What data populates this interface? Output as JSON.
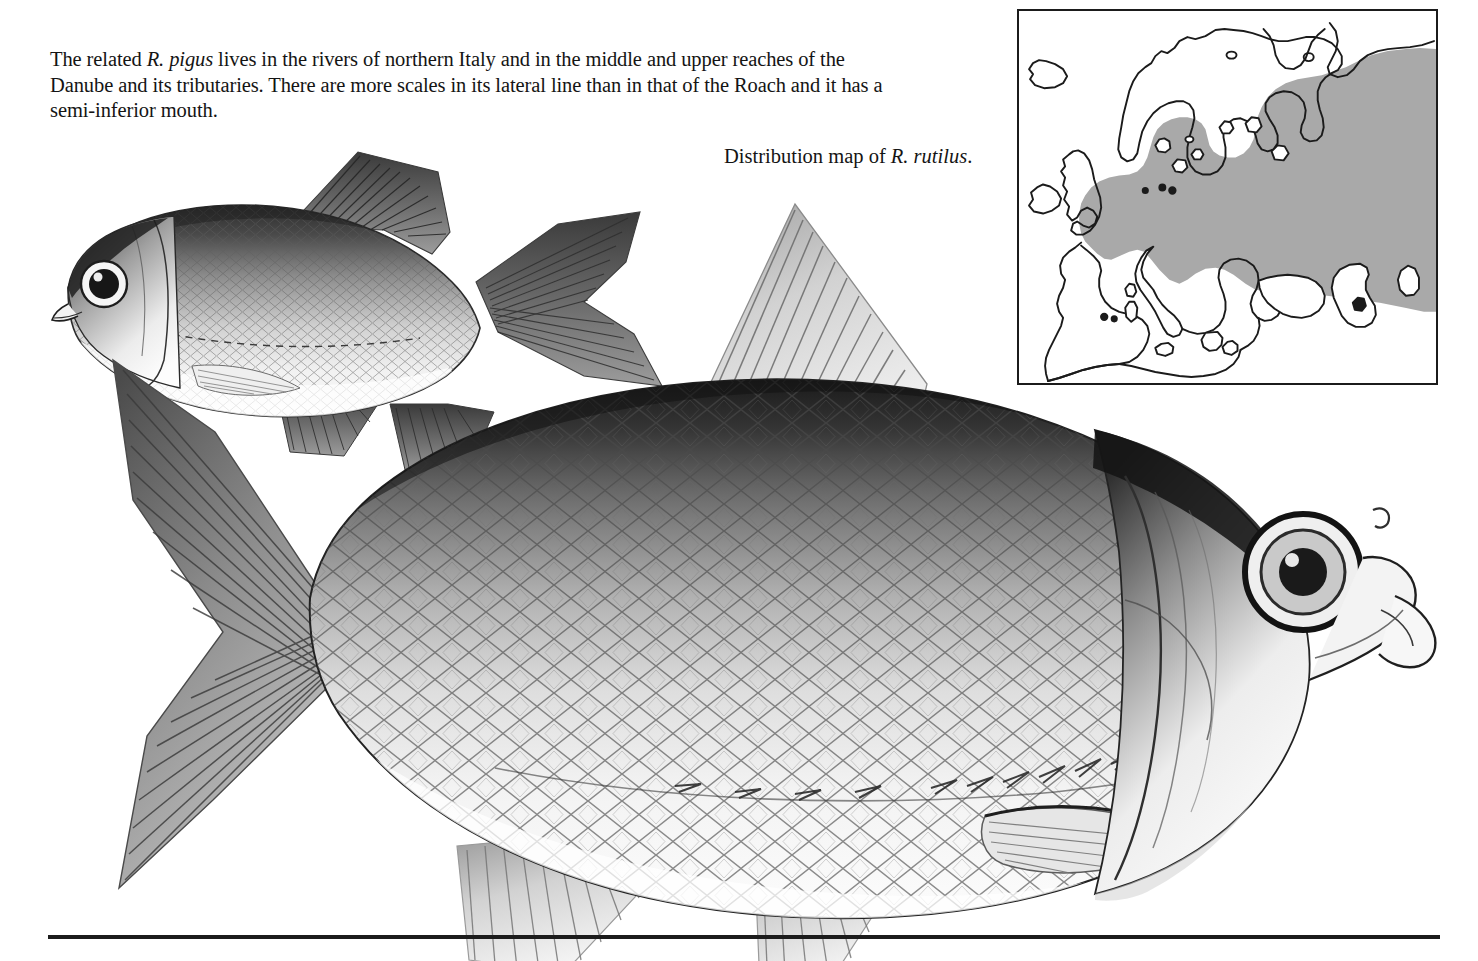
{
  "body_text": {
    "segments": [
      {
        "text": "The related ",
        "style": "roman"
      },
      {
        "text": "R. pigus",
        "style": "italic"
      },
      {
        "text": " lives in the rivers of northern Italy and in the middle and upper reaches of the Danube and its tributaries. There are more scales in its lateral line than in that of the Roach and it has a semi-inferior mouth.",
        "style": "roman"
      }
    ],
    "plain": "The related R. pigus lives in the rivers of northern Italy and in the middle and upper reaches of the Danube and its tributaries. There are more scales in its lateral line than in that of the Roach and it has a semi-inferior mouth.",
    "lead": "The related ",
    "species_italic": "R. pigus",
    "rest": " lives in the rivers of northern Italy and in the middle and upper reaches of the Danube and its tributaries. There are more scales in its lateral line than in that of the Roach and it has a semi-inferior mouth."
  },
  "map_caption": {
    "lead": "Distribution map of ",
    "species_italic": "R. rutilus",
    "trail": "."
  },
  "map": {
    "title_region": "Europe",
    "shaded_area_label": "distribution range",
    "fill_color": "#a9a9a9",
    "outline_color": "#1b1b1b",
    "background_color": "#ffffff",
    "border_color": "#1b1b1b"
  },
  "illustrations": {
    "upper_fish": {
      "name": "R. pigus",
      "orientation": "facing-left",
      "parts": [
        "eye",
        "mouth",
        "operculum",
        "dorsal-fin",
        "caudal-fin",
        "pectoral-fin",
        "pelvic-fin",
        "anal-fin",
        "lateral-line",
        "scales"
      ]
    },
    "lower_fish": {
      "name": "R. rutilus (Roach)",
      "orientation": "facing-right",
      "parts": [
        "eye",
        "mouth",
        "operculum",
        "dorsal-fin",
        "caudal-fin",
        "pectoral-fin",
        "pelvic-fin",
        "anal-fin",
        "lateral-line",
        "scales"
      ]
    }
  },
  "colors": {
    "ink": "#141414",
    "paper": "#ffffff",
    "map_gray": "#a9a9a9"
  }
}
